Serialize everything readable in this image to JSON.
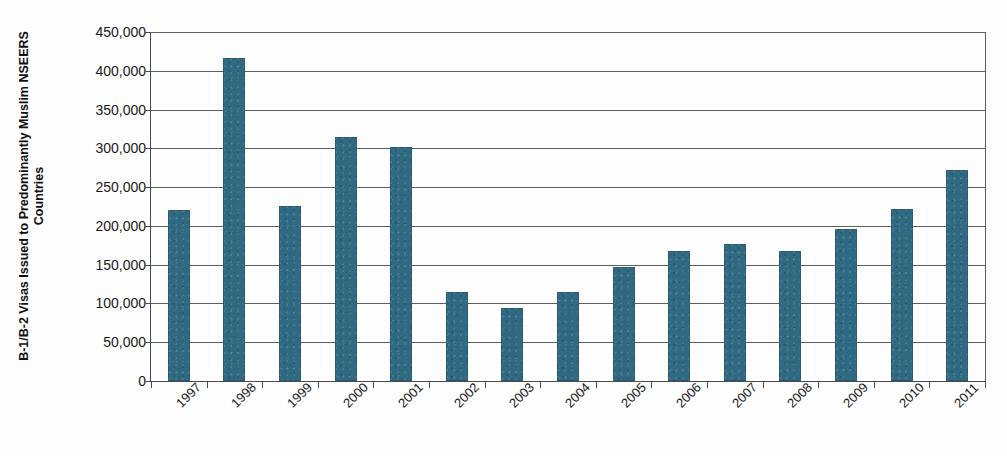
{
  "chart_data": {
    "type": "bar",
    "title": "",
    "xlabel": "",
    "ylabel": "B-1/B-2 Visas Issued to Predominantly Muslim NSEERS Countries",
    "categories": [
      "1997",
      "1998",
      "1999",
      "2000",
      "2001",
      "2002",
      "2003",
      "2004",
      "2005",
      "2006",
      "2007",
      "2008",
      "2009",
      "2010",
      "2011"
    ],
    "values": [
      220000,
      416000,
      226000,
      314000,
      302000,
      115000,
      94000,
      115000,
      147000,
      168000,
      177000,
      168000,
      196000,
      222000,
      272000
    ],
    "series": [
      {
        "name": "B-1/B-2 Visas Issued to Predominantly Muslim NSEERS Countries",
        "values": [
          220000,
          416000,
          226000,
          314000,
          302000,
          115000,
          94000,
          115000,
          147000,
          168000,
          177000,
          168000,
          196000,
          222000,
          272000
        ]
      }
    ],
    "ylim": [
      0,
      450000
    ],
    "ytick_values": [
      0,
      50000,
      100000,
      150000,
      200000,
      250000,
      300000,
      350000,
      400000,
      450000
    ],
    "ytick_labels": [
      "0",
      "50,000",
      "100,000",
      "150,000",
      "200,000",
      "250,000",
      "300,000",
      "350,000",
      "400,000",
      "450,000"
    ],
    "grid": true,
    "grid_axis": "y",
    "legend": false,
    "legend_position": "none",
    "bar_color": "#2f6a82",
    "gridline_color": "#5e5e5e",
    "axis_color": "#4a4a4a",
    "background_color": "#fdfdfd",
    "text_color": "#1a1a1a",
    "xlabel_rotation": -45
  },
  "axis": {
    "y_title": "B-1/B-2 Visas Issued to Predominantly Muslim NSEERS Countries"
  }
}
